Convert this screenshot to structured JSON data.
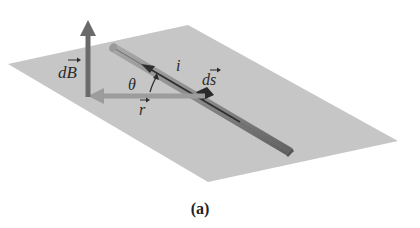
{
  "figure": {
    "caption": "(a)",
    "colors": {
      "background": "#ffffff",
      "plane": "#c4c4c4",
      "rod": "#8a8a8a",
      "rod_dark": "#5e5e5e",
      "dB_arrow": "#6a6a6a",
      "r_arrow": "#9a9a9a",
      "ds_arrow": "#3d3d3d",
      "label": "#2b2b2b"
    },
    "labels": {
      "dB": "dB",
      "theta": "θ",
      "current": "i",
      "ds": "ds",
      "r": "r"
    },
    "elements": {
      "plane": "horizontal plane containing wire",
      "wire": "straight current-carrying wire",
      "dB_vector": "magnetic field element, perpendicular to plane",
      "r_vector": "position vector from ds to field point",
      "ds_vector": "length element along wire in direction of current",
      "theta_angle": "angle between ds and r"
    }
  }
}
